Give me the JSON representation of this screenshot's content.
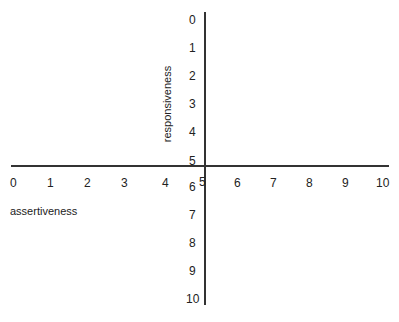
{
  "chart_data": {
    "type": "quadrant",
    "xlabel": "assertiveness",
    "ylabel": "responsiveness",
    "x_ticks": [
      "0",
      "1",
      "2",
      "3",
      "4",
      "5",
      "6",
      "7",
      "8",
      "9",
      "10"
    ],
    "y_ticks": [
      "0",
      "1",
      "2",
      "3",
      "4",
      "5",
      "6",
      "7",
      "8",
      "9",
      "10"
    ],
    "xlim": [
      0,
      10
    ],
    "ylim": [
      0,
      10
    ],
    "y_direction": "top-to-bottom",
    "axis_cross": [
      5,
      5
    ],
    "grid": false,
    "legend": null
  },
  "diagram": {
    "x_axis_label": "assertiveness",
    "y_axis_label": "responsiveness",
    "line_color": "#333333"
  }
}
